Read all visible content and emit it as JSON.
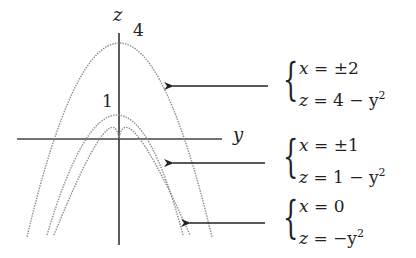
{
  "diagram": {
    "type": "level-curves",
    "axes": {
      "vertical_label": "z",
      "horizontal_label": "y"
    },
    "tick_labels": [
      {
        "text": "4",
        "meaning": "apex of outer parabola"
      },
      {
        "text": "1",
        "meaning": "apex of middle parabola"
      }
    ],
    "curves": [
      {
        "name": "outer",
        "apex_z": 4,
        "system": {
          "line1_lhs": "x",
          "line1_rhs": "±2",
          "line2_lhs": "z",
          "line2_rhs": "4 − y",
          "exponent": "2"
        }
      },
      {
        "name": "middle",
        "apex_z": 1,
        "system": {
          "line1_lhs": "x",
          "line1_rhs": "±1",
          "line2_lhs": "z",
          "line2_rhs": "1 − y",
          "exponent": "2"
        }
      },
      {
        "name": "inner",
        "apex_z": 0,
        "system": {
          "line1_lhs": "x",
          "line1_rhs": "0",
          "line2_lhs": "z",
          "line2_rhs": "−y",
          "exponent": "2"
        }
      }
    ],
    "eq_sign": "=",
    "colors": {
      "curve": "#8a8a8a",
      "axis": "#333333",
      "arrow": "#222222"
    }
  }
}
